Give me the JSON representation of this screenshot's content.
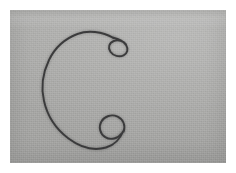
{
  "image": {
    "kind": "photograph",
    "caption": "Thin dark wire bent into an open C shape with a small loop curled at each end, lying on a flat gray background",
    "width": 236,
    "height": 173,
    "border": {
      "style": "white photographic paper margin",
      "color": "#ffffff",
      "inset_px": 10
    },
    "plate": {
      "width": 216,
      "height": 153,
      "background_color": "#a9a9a7",
      "lighting": "slightly brighter toward the upper right",
      "texture": "fine film grain"
    },
    "subject": {
      "name": "bent wire",
      "stroke_color": "#3b3b3c",
      "stroke_width_px": 1.9,
      "shape": "open C / horseshoe opening to the right",
      "parts": [
        {
          "name": "main-arc",
          "description": "large open arc sweeping left, opening toward the right side"
        },
        {
          "name": "upper-loop",
          "description": "small elliptical curl at the upper right end, wire crosses over itself",
          "center": [
            104,
            32
          ],
          "radius_px": 7
        },
        {
          "name": "lower-loop",
          "description": "small circular ring at the lower right end",
          "center": [
            107,
            116
          ],
          "radius_px": 8
        }
      ]
    }
  },
  "colors": {
    "paper": "#ffffff",
    "backdrop": "#a9a9a7",
    "wire": "#3b3b3c",
    "wire_shadow": "rgba(40,40,40,0.22)"
  }
}
